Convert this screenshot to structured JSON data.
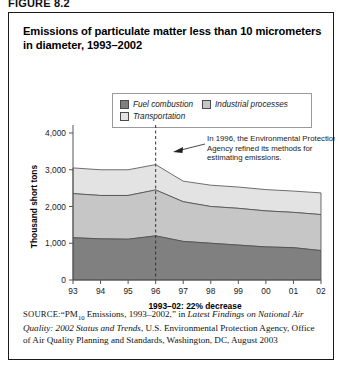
{
  "figure": {
    "label": "FIGURE 8.2",
    "title": "Emissions of particulate matter less than 10 micrometers in diameter, 1993–2002"
  },
  "legend": {
    "items": [
      {
        "label": "Fuel combustion",
        "color": "#808080"
      },
      {
        "label": "Industrial processes",
        "color": "#c6c6c6"
      },
      {
        "label": "Transportation",
        "color": "#e3e3e3"
      }
    ]
  },
  "annotation": {
    "line1": "In 1996, the Environmental Protection",
    "line2": "Agency refined its methods for",
    "line3": "estimating emissions.",
    "marker_year": "96"
  },
  "x_caption": "1993–02: 22% decrease",
  "source": {
    "lead": "SOURCE:",
    "part1": "“PM",
    "sub": "10",
    "part2": " Emissions, 1993–2002,” in ",
    "italic": "Latest Findings on National Air Quality: 2002 Status and Trends",
    "part3": ", U.S. Environmental Protection Agency, Office of Air Quality Planning and Standards, Washington, DC, August 2003"
  },
  "chart_data": {
    "type": "area",
    "title": "Emissions of particulate matter less than 10 micrometers in diameter, 1993–2002",
    "xlabel": "",
    "ylabel": "Thousand short tons",
    "categories": [
      "93",
      "94",
      "95",
      "96",
      "97",
      "98",
      "99",
      "00",
      "01",
      "02"
    ],
    "x_full": [
      1993,
      1994,
      1995,
      1996,
      1997,
      1998,
      1999,
      2000,
      2001,
      2002
    ],
    "ylim": [
      0,
      4000
    ],
    "yticks": [
      0,
      1000,
      2000,
      3000,
      4000
    ],
    "ytick_labels": [
      "0",
      "1,000",
      "2,000",
      "3,000",
      "4,000"
    ],
    "grid": false,
    "stacked": true,
    "legend_position": "top-center",
    "series": [
      {
        "name": "Fuel combustion",
        "color": "#808080",
        "values": [
          1150,
          1120,
          1110,
          1200,
          1050,
          1000,
          950,
          900,
          880,
          800
        ]
      },
      {
        "name": "Industrial processes",
        "color": "#c6c6c6",
        "values": [
          1200,
          1180,
          1190,
          1250,
          1080,
          1000,
          1000,
          980,
          960,
          980
        ]
      },
      {
        "name": "Transportation",
        "color": "#e3e3e3",
        "values": [
          700,
          700,
          700,
          690,
          560,
          580,
          580,
          580,
          580,
          590
        ]
      }
    ],
    "cumulative_totals": [
      3050,
      3000,
      3000,
      3140,
      2690,
      2580,
      2530,
      2460,
      2420,
      2370
    ],
    "annotations": [
      {
        "text": "In 1996, the Environmental Protection Agency refined its methods for estimating emissions.",
        "at_x": "96",
        "marker": "dashed-vertical-line"
      },
      {
        "text": "1993–02: 22% decrease",
        "position": "below-x-axis"
      }
    ]
  }
}
